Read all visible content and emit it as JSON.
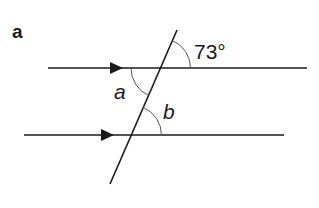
{
  "panel_label": "a",
  "diagram": {
    "type": "parallel lines cut by a transversal",
    "lines": [
      {
        "name": "top-parallel-line",
        "has_arrow": true
      },
      {
        "name": "bottom-parallel-line",
        "has_arrow": true
      },
      {
        "name": "transversal"
      }
    ],
    "angles": {
      "given": "73°",
      "unknown_a": "a",
      "unknown_b": "b"
    }
  },
  "colors": {
    "line": "#1a1a1a",
    "arc": "#555555",
    "background": "#ffffff"
  }
}
